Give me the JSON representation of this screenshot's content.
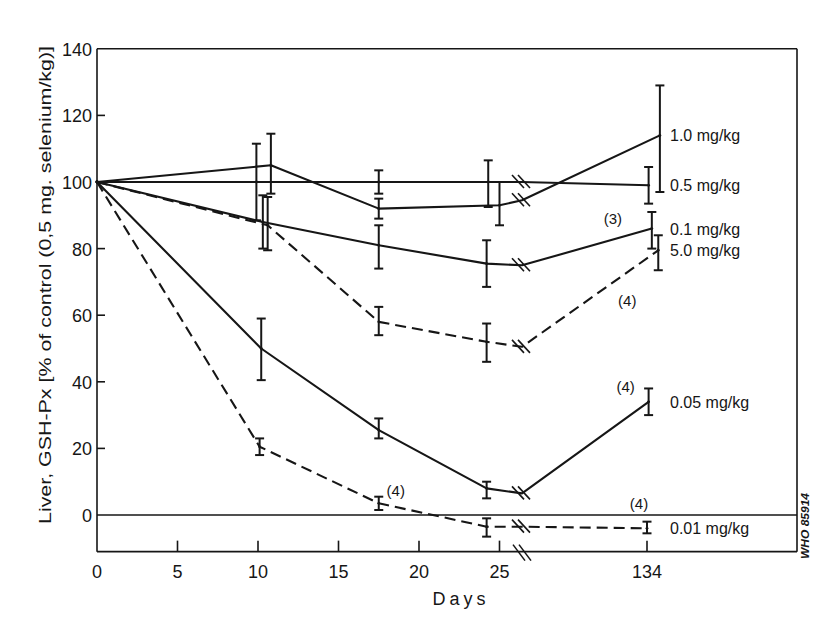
{
  "figure_code": "WHO 85914",
  "chart_data": {
    "type": "line",
    "title": "",
    "xlabel": "Days",
    "ylabel": "Liver, GSH-Px [% of control (0,5 mg. selenium/kg)]",
    "xlim": [
      0,
      134
    ],
    "ylim": [
      -11,
      140
    ],
    "x_axis_break": {
      "after": 25,
      "before": 134
    },
    "x_ticks": [
      0,
      5,
      10,
      15,
      20,
      25,
      134
    ],
    "x_tick_labels": [
      "0",
      "5",
      "10",
      "15",
      "20",
      "25",
      "134"
    ],
    "y_ticks": [
      0,
      20,
      40,
      60,
      80,
      100,
      120,
      140
    ],
    "y_tick_labels": [
      "0",
      "20",
      "40",
      "60",
      "80",
      "100",
      "120",
      "140"
    ],
    "grid": false,
    "legend": "inline labels at right end of each series",
    "reference_lines": [
      {
        "axis": "y",
        "value": 0
      }
    ],
    "series": [
      {
        "name": "1.0 mg/kg",
        "line_style": "solid",
        "x": [
          0,
          10.8,
          17.5,
          25,
          134.8
        ],
        "y": [
          100,
          105,
          92,
          93,
          114
        ],
        "error_low": [
          null,
          96.5,
          89,
          87,
          97
        ],
        "error_high": [
          null,
          114.5,
          95,
          100,
          129
        ],
        "break_value": 94.5
      },
      {
        "name": "0.5 mg/kg",
        "line_style": "solid",
        "x": [
          0,
          9.9,
          17.5,
          24.3,
          134.1
        ],
        "y": [
          100,
          100,
          100,
          100,
          99
        ],
        "error_low": [
          null,
          88.5,
          96.5,
          92.5,
          93.5
        ],
        "error_high": [
          null,
          111.5,
          103.5,
          106.5,
          104.5
        ],
        "break_value": 100
      },
      {
        "name": "0.1 mg/kg",
        "line_style": "solid",
        "x": [
          0,
          10.3,
          17.5,
          24.2,
          134.3
        ],
        "y": [
          100,
          88,
          81,
          75.5,
          86
        ],
        "error_low": [
          null,
          80,
          74,
          68.5,
          80
        ],
        "error_high": [
          null,
          96,
          87,
          82.5,
          91
        ],
        "break_value": 75
      },
      {
        "name": "5.0 mg/kg",
        "line_style": "dashed",
        "x": [
          0,
          10.6,
          17.5,
          24.2,
          134.7
        ],
        "y": [
          100,
          87,
          58,
          52,
          79.5
        ],
        "error_low": [
          null,
          79.5,
          54,
          46,
          73.5
        ],
        "error_high": [
          null,
          95.5,
          62.5,
          57.5,
          84
        ],
        "break_value": 50.5
      },
      {
        "name": "0.05 mg/kg",
        "line_style": "solid",
        "x": [
          0,
          10.2,
          17.5,
          24.2,
          134.1
        ],
        "y": [
          100,
          50,
          25.5,
          8,
          34
        ],
        "error_low": [
          null,
          40.5,
          23,
          5,
          30
        ],
        "error_high": [
          null,
          59,
          29,
          10,
          38
        ],
        "break_value": 6.5
      },
      {
        "name": "0.01 mg/kg",
        "line_style": "dashed",
        "x": [
          0,
          10.1,
          17.5,
          24.2,
          134
        ],
        "y": [
          100,
          20.5,
          3.5,
          -3.5,
          -4
        ],
        "error_low": [
          null,
          18,
          1.5,
          -6.5,
          -5.5
        ],
        "error_high": [
          null,
          23,
          5.5,
          -1,
          -2
        ],
        "break_value": -3.5
      }
    ],
    "annotations": [
      {
        "series_index": 2,
        "point_index": 4,
        "text": "(3)"
      },
      {
        "series_index": 3,
        "point_index": 4,
        "text": "(4)"
      },
      {
        "series_index": 4,
        "point_index": 4,
        "text": "(4)"
      },
      {
        "series_index": 5,
        "point_index": 2,
        "text": "(4)"
      },
      {
        "series_index": 5,
        "point_index": 4,
        "text": "(4)"
      }
    ]
  }
}
